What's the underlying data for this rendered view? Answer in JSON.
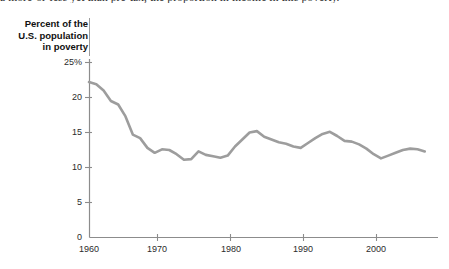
{
  "page": {
    "top_text_fragment": "a more-or-less yet than pre-tax, the proportion in income in this poverty."
  },
  "figure": {
    "axis_title": "Percent of the\nU.S. population\nin poverty",
    "line_color": "#9d9d9d",
    "axis_color": "#8c8c8c"
  },
  "chart_data": {
    "type": "line",
    "title": "",
    "xlabel": "",
    "ylabel": "Percent of the U.S. population in poverty",
    "xlim": [
      1959,
      2007
    ],
    "ylim": [
      0,
      25
    ],
    "grid": false,
    "legend": null,
    "ytick_labels": [
      "25%",
      "20",
      "15",
      "10",
      "5",
      "0"
    ],
    "ytick_values": [
      25,
      20,
      15,
      10,
      5,
      0
    ],
    "xtick_labels": [
      "1960",
      "1970",
      "1980",
      "1990",
      "2000"
    ],
    "xtick_values": [
      1960,
      1970,
      1980,
      1990,
      2000
    ],
    "series": [
      {
        "name": "Poverty rate",
        "color": "#9d9d9d",
        "x": [
          1960,
          1961,
          1962,
          1963,
          1964,
          1965,
          1966,
          1967,
          1968,
          1969,
          1970,
          1971,
          1972,
          1973,
          1974,
          1975,
          1976,
          1977,
          1978,
          1979,
          1980,
          1981,
          1982,
          1983,
          1984,
          1985,
          1986,
          1987,
          1988,
          1989,
          1990,
          1991,
          1992,
          1993,
          1994,
          1995,
          1996,
          1997,
          1998,
          1999,
          2000,
          2001,
          2002,
          2003,
          2004,
          2005,
          2006
        ],
        "values": [
          22.2,
          21.9,
          21.0,
          19.5,
          19.0,
          17.3,
          14.7,
          14.2,
          12.8,
          12.1,
          12.6,
          12.5,
          11.9,
          11.1,
          11.2,
          12.3,
          11.8,
          11.6,
          11.4,
          11.7,
          13.0,
          14.0,
          15.0,
          15.2,
          14.4,
          14.0,
          13.6,
          13.4,
          13.0,
          12.8,
          13.5,
          14.2,
          14.8,
          15.1,
          14.5,
          13.8,
          13.7,
          13.3,
          12.7,
          11.9,
          11.3,
          11.7,
          12.1,
          12.5,
          12.7,
          12.6,
          12.3
        ]
      }
    ]
  }
}
